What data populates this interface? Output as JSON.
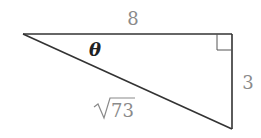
{
  "diagram": {
    "type": "right-triangle",
    "labels": {
      "top_side": "8",
      "right_side": "3",
      "hypotenuse_radicand": "73",
      "angle": "θ"
    },
    "colors": {
      "edges": "#333333",
      "side_labels": "#8a8a8a",
      "angle_label": "#222222"
    }
  }
}
